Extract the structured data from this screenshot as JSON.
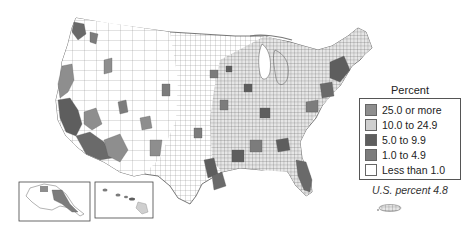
{
  "map": {
    "subject": "United States counties choropleth",
    "insets": [
      "Alaska",
      "Hawaii",
      "Puerto Rico"
    ]
  },
  "legend": {
    "title": "Percent",
    "items": [
      {
        "label": "25.0 or more",
        "color": "#8e8e8e"
      },
      {
        "label": "10.0 to 24.9",
        "color": "#cfcfcf"
      },
      {
        "label": "5.0 to 9.9",
        "color": "#5e5e5e"
      },
      {
        "label": "1.0 to 4.9",
        "color": "#7c7c7c"
      },
      {
        "label": "Less than 1.0",
        "color": "#ffffff"
      }
    ],
    "us_percent": "U.S. percent 4.8"
  }
}
